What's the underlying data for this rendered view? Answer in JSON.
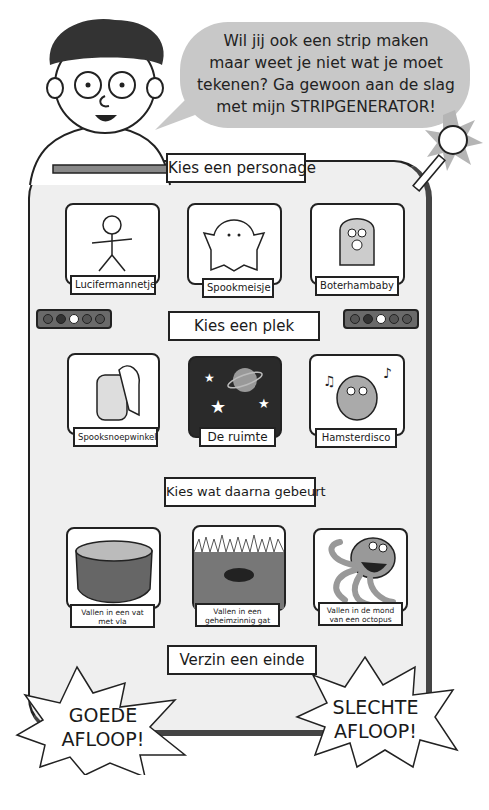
{
  "speech_bubble": {
    "lines": [
      "Wil jij ook een strip maken",
      "maar weet je niet wat je moet",
      "tekenen? Ga gewoon aan de slag",
      "met mijn STRIPGENERATOR!"
    ]
  },
  "sections": [
    {
      "heading": "Kies een personage",
      "options": [
        {
          "label": "Lucifermannetje",
          "icon": "stick-figure-icon"
        },
        {
          "label": "Spookmeisje",
          "icon": "ghost-girl-icon"
        },
        {
          "label": "Boterhambaby",
          "icon": "sandwich-baby-icon"
        }
      ]
    },
    {
      "heading": "Kies een plek",
      "options": [
        {
          "label": "Spooksnoepwinkel",
          "icon": "ghost-candy-jar-icon"
        },
        {
          "label": "De ruimte",
          "icon": "space-planet-icon"
        },
        {
          "label": "Hamsterdisco",
          "icon": "dancing-hamster-icon"
        }
      ]
    },
    {
      "heading": "Kies wat daarna gebeurt",
      "options": [
        {
          "label": "Vallen in een vat met vla",
          "icon": "custard-vat-icon"
        },
        {
          "label": "Vallen in een geheimzinnig gat",
          "icon": "mysterious-hole-icon"
        },
        {
          "label": "Vallen in de mond van een octopus",
          "icon": "octopus-icon"
        }
      ]
    },
    {
      "heading": "Verzin een einde",
      "options": [
        {
          "label": "GOEDE AFLOOP!",
          "line1": "GOEDE",
          "line2": "AFLOOP!"
        },
        {
          "label": "SLECHTE AFLOOP!",
          "line1": "SLECHTE",
          "line2": "AFLOOP!"
        }
      ]
    }
  ],
  "colors": {
    "bubble": "#c8c8c8",
    "board": "#efefef",
    "outline": "#222222",
    "wire": "#9a9a9a",
    "space": "#2a2a2a"
  }
}
